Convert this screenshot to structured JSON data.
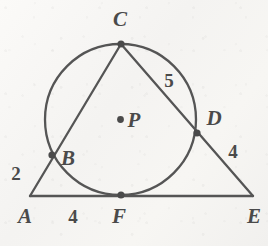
{
  "figure": {
    "kind": "circle-with-circumscribed-triangle",
    "background_color": "#f7f6f4",
    "stroke_color": "#555555",
    "label_color": "#4a4a4a",
    "circle": {
      "center_label": "P",
      "cx": 120.5,
      "cy": 119.5,
      "r": 75.5
    },
    "points": [
      {
        "id": "A",
        "label": "A",
        "x": 30,
        "y": 196,
        "label_x": 25,
        "label_y": 216,
        "marked": false
      },
      {
        "id": "B",
        "label": "B",
        "x": 52,
        "y": 155,
        "label_x": 68,
        "label_y": 158,
        "marked": true
      },
      {
        "id": "C",
        "label": "C",
        "x": 121,
        "y": 44,
        "label_x": 120,
        "label_y": 19,
        "marked": true
      },
      {
        "id": "D",
        "label": "D",
        "x": 197,
        "y": 133,
        "label_x": 214,
        "label_y": 118,
        "marked": true
      },
      {
        "id": "E",
        "label": "E",
        "x": 253,
        "y": 196,
        "label_x": 254,
        "label_y": 216,
        "marked": false
      },
      {
        "id": "F",
        "label": "F",
        "x": 121,
        "y": 195,
        "label_x": 119,
        "label_y": 216,
        "marked": true
      },
      {
        "id": "P",
        "label": "P",
        "x": 120.5,
        "y": 119.5,
        "label_x": 134,
        "label_y": 120,
        "marked": true
      }
    ],
    "segments": [
      {
        "id": "AC",
        "from": "A",
        "to": "C"
      },
      {
        "id": "AE",
        "from": "A",
        "to": "E"
      },
      {
        "id": "CE",
        "from": "C",
        "to": "E"
      }
    ],
    "measures": [
      {
        "id": "AB",
        "value": "2",
        "x": 16,
        "y": 173,
        "segment": "A to B"
      },
      {
        "id": "CD",
        "value": "5",
        "x": 169,
        "y": 80,
        "segment": "C to D"
      },
      {
        "id": "DE",
        "value": "4",
        "x": 233,
        "y": 151,
        "segment": "D to E"
      },
      {
        "id": "AF",
        "value": "4",
        "x": 73,
        "y": 216,
        "segment": "A to F"
      }
    ]
  }
}
